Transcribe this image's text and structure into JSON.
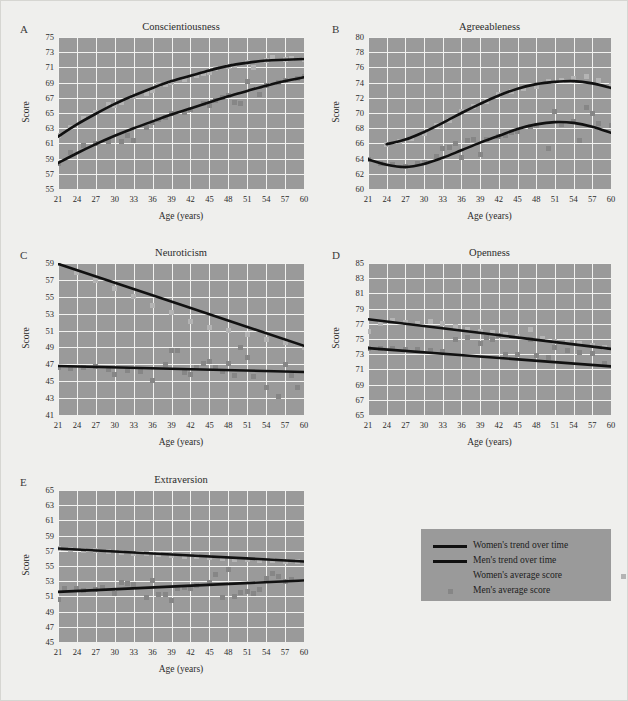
{
  "figure": {
    "background_color": "#efefed",
    "plot_background_color": "#9a9a9a",
    "grid_color": "#f2f2f0",
    "trend_line_color": "#111111",
    "women_marker_color": "#b4b4b4",
    "men_marker_color": "#868686"
  },
  "legend": {
    "items": [
      {
        "label": "Women's trend over time",
        "marker": "line-thick-black",
        "color": "#111111"
      },
      {
        "label": "Men's trend over time",
        "marker": "line-thick-black",
        "color": "#111111"
      },
      {
        "label": "Women's average score",
        "marker": "square",
        "color": "#b4b4b4"
      },
      {
        "label": "Men's average score",
        "marker": "square",
        "color": "#868686"
      }
    ]
  },
  "chart_data": [
    {
      "panel": "A",
      "type": "scatter",
      "title": "Conscientiousness",
      "xlabel": "Age (years)",
      "ylabel": "Score",
      "xlim": [
        21,
        60
      ],
      "ylim": [
        55,
        75
      ],
      "xticks": [
        21,
        24,
        27,
        30,
        33,
        36,
        39,
        42,
        45,
        48,
        51,
        54,
        57,
        60
      ],
      "yticks": [
        55,
        57,
        59,
        61,
        63,
        65,
        67,
        69,
        71,
        73,
        75
      ],
      "grid": true,
      "legend_position": "external-center",
      "series": [
        {
          "name": "Women's trend over time",
          "role": "trend",
          "x": [
            21,
            24,
            27,
            30,
            33,
            36,
            39,
            42,
            45,
            48,
            51,
            54,
            57,
            60
          ],
          "values": [
            61.9,
            63.5,
            64.9,
            66.2,
            67.3,
            68.3,
            69.2,
            69.9,
            70.6,
            71.2,
            71.6,
            71.9,
            72.0,
            72.1
          ]
        },
        {
          "name": "Men's trend over time",
          "role": "trend",
          "x": [
            21,
            24,
            27,
            30,
            33,
            36,
            39,
            42,
            45,
            48,
            51,
            54,
            57,
            60
          ],
          "values": [
            58.4,
            59.7,
            60.9,
            62.0,
            63.0,
            63.9,
            64.8,
            65.6,
            66.4,
            67.2,
            67.9,
            68.6,
            69.2,
            69.7
          ]
        },
        {
          "name": "Women's average score",
          "role": "points",
          "x": [
            21,
            23,
            25,
            27,
            29,
            30,
            31,
            33,
            35,
            36,
            37,
            38,
            39,
            41,
            43,
            44,
            45,
            46,
            48,
            49,
            51,
            52,
            54,
            55,
            57,
            58,
            60
          ],
          "values": [
            62.1,
            63.1,
            64.3,
            65.1,
            66.1,
            66.0,
            66.4,
            67.2,
            67.6,
            68.0,
            68.7,
            68.8,
            69.0,
            69.4,
            70.0,
            70.2,
            70.3,
            70.9,
            71.1,
            71.3,
            71.6,
            71.0,
            71.9,
            72.3,
            72.0,
            72.2,
            72.1
          ]
        },
        {
          "name": "Men's average score",
          "role": "points",
          "x": [
            21,
            23,
            25,
            27,
            29,
            31,
            32,
            33,
            35,
            36,
            37,
            38,
            39,
            41,
            42,
            44,
            45,
            46,
            47,
            48,
            49,
            50,
            51,
            53,
            54,
            56,
            57,
            59,
            60
          ],
          "values": [
            58.4,
            59.8,
            60.7,
            61.0,
            61.2,
            61.3,
            62.1,
            61.4,
            63.1,
            63.8,
            64.2,
            64.4,
            64.9,
            65.1,
            65.4,
            66.2,
            66.0,
            66.6,
            67.0,
            67.3,
            66.4,
            66.3,
            69.2,
            67.5,
            68.6,
            69.0,
            69.3,
            69.6,
            69.8
          ]
        }
      ]
    },
    {
      "panel": "B",
      "type": "scatter",
      "title": "Agreeableness",
      "xlabel": "Age (years)",
      "ylabel": "Score",
      "xlim": [
        21,
        60
      ],
      "ylim": [
        60,
        80
      ],
      "xticks": [
        21,
        24,
        27,
        30,
        33,
        36,
        39,
        42,
        45,
        48,
        51,
        54,
        57,
        60
      ],
      "yticks": [
        60,
        62,
        64,
        66,
        68,
        70,
        72,
        74,
        76,
        78,
        80
      ],
      "grid": true,
      "series": [
        {
          "name": "Women's trend over time",
          "role": "trend",
          "x": [
            24,
            27,
            30,
            33,
            36,
            39,
            42,
            45,
            48,
            51,
            54,
            57,
            60
          ],
          "values": [
            65.9,
            66.5,
            67.5,
            68.7,
            70.0,
            71.2,
            72.3,
            73.2,
            73.8,
            74.1,
            74.2,
            73.9,
            73.3
          ]
        },
        {
          "name": "Men's trend over time",
          "role": "trend",
          "x": [
            21,
            24,
            27,
            30,
            33,
            36,
            39,
            42,
            45,
            48,
            51,
            54,
            57,
            60
          ],
          "values": [
            63.9,
            63.2,
            62.9,
            63.3,
            64.1,
            65.1,
            66.1,
            67.0,
            67.9,
            68.5,
            68.8,
            68.7,
            68.2,
            67.4
          ]
        },
        {
          "name": "Women's average score",
          "role": "points",
          "x": [
            24,
            26,
            28,
            30,
            32,
            34,
            36,
            38,
            40,
            42,
            44,
            46,
            48,
            50,
            52,
            54,
            56,
            58,
            60
          ],
          "values": [
            65.9,
            66.3,
            66.6,
            67.3,
            68.4,
            69.0,
            70.2,
            70.8,
            71.5,
            72.4,
            72.8,
            73.2,
            73.5,
            74.1,
            74.3,
            74.6,
            74.8,
            74.3,
            73.6
          ]
        },
        {
          "name": "Men's average score",
          "role": "points",
          "x": [
            21,
            23,
            25,
            27,
            29,
            30,
            32,
            33,
            34,
            35,
            36,
            37,
            38,
            39,
            40,
            42,
            43,
            44,
            45,
            47,
            48,
            50,
            51,
            52,
            54,
            55,
            56,
            57,
            58,
            60
          ],
          "values": [
            63.9,
            63.4,
            63.2,
            63.0,
            63.4,
            63.5,
            64.3,
            65.3,
            65.5,
            66.0,
            64.1,
            66.4,
            66.5,
            64.6,
            66.5,
            66.9,
            67.0,
            67.4,
            67.6,
            68.2,
            68.4,
            65.3,
            70.2,
            68.5,
            68.9,
            66.4,
            70.7,
            69.9,
            68.6,
            68.4
          ]
        }
      ]
    },
    {
      "panel": "C",
      "type": "scatter",
      "title": "Neuroticism",
      "xlabel": "Age (years)",
      "ylabel": "Score",
      "xlim": [
        21,
        60
      ],
      "ylim": [
        41,
        59
      ],
      "xticks": [
        21,
        24,
        27,
        30,
        33,
        36,
        39,
        42,
        45,
        48,
        51,
        54,
        57,
        60
      ],
      "yticks": [
        41,
        43,
        45,
        47,
        49,
        51,
        53,
        55,
        57,
        59
      ],
      "grid": true,
      "series": [
        {
          "name": "Women's trend over time",
          "role": "trend",
          "x": [
            21,
            60
          ],
          "values": [
            58.9,
            49.2
          ]
        },
        {
          "name": "Men's trend over time",
          "role": "trend",
          "x": [
            21,
            60
          ],
          "values": [
            46.8,
            46.1
          ]
        },
        {
          "name": "Women's average score",
          "role": "points",
          "x": [
            21,
            24,
            27,
            30,
            33,
            36,
            39,
            42,
            45,
            48,
            51,
            54,
            57,
            60
          ],
          "values": [
            58.9,
            57.9,
            56.9,
            56.0,
            55.0,
            54.0,
            53.1,
            52.1,
            51.4,
            51.0,
            50.5,
            50.0,
            49.6,
            49.0
          ]
        },
        {
          "name": "Men's average score",
          "role": "points",
          "x": [
            21,
            23,
            25,
            27,
            29,
            30,
            32,
            34,
            36,
            38,
            39,
            40,
            41,
            42,
            43,
            44,
            45,
            46,
            47,
            48,
            49,
            50,
            51,
            52,
            54,
            56,
            57,
            58,
            59,
            60
          ],
          "values": [
            46.6,
            46.5,
            46.6,
            46.7,
            46.4,
            45.8,
            46.3,
            46.1,
            45.1,
            47.0,
            48.6,
            48.6,
            46.0,
            45.8,
            46.6,
            47.1,
            47.3,
            46.6,
            46.2,
            47.1,
            45.7,
            49.0,
            47.8,
            45.6,
            44.2,
            43.2,
            47.0,
            45.7,
            44.2,
            40.6
          ]
        }
      ]
    },
    {
      "panel": "D",
      "type": "scatter",
      "title": "Openness",
      "xlabel": "Age (years)",
      "ylabel": "Score",
      "xlim": [
        21,
        60
      ],
      "ylim": [
        65,
        85
      ],
      "xticks": [
        21,
        24,
        27,
        30,
        33,
        36,
        39,
        42,
        45,
        48,
        51,
        54,
        57,
        60
      ],
      "yticks": [
        65,
        67,
        69,
        71,
        73,
        75,
        77,
        79,
        81,
        83,
        85
      ],
      "grid": true,
      "series": [
        {
          "name": "Women's trend over time",
          "role": "trend",
          "x": [
            21,
            60
          ],
          "values": [
            77.6,
            73.7
          ]
        },
        {
          "name": "Men's trend over time",
          "role": "trend",
          "x": [
            21,
            60
          ],
          "values": [
            73.8,
            71.4
          ]
        },
        {
          "name": "Women's average score",
          "role": "points",
          "x": [
            21,
            23,
            25,
            27,
            29,
            31,
            33,
            35,
            37,
            39,
            41,
            43,
            45,
            47,
            49,
            51,
            53,
            55,
            57,
            59
          ],
          "values": [
            76.0,
            77.0,
            77.4,
            77.2,
            77.0,
            77.3,
            77.1,
            76.6,
            76.3,
            76.0,
            75.9,
            75.6,
            75.3,
            76.3,
            75.1,
            74.7,
            74.5,
            74.4,
            74.2,
            73.9
          ]
        },
        {
          "name": "Men's average score",
          "role": "points",
          "x": [
            21,
            23,
            25,
            27,
            29,
            31,
            33,
            35,
            37,
            39,
            40,
            41,
            42,
            43,
            45,
            47,
            48,
            50,
            51,
            53,
            55,
            57,
            59
          ],
          "values": [
            73.8,
            73.7,
            73.8,
            73.6,
            73.6,
            73.5,
            73.4,
            74.9,
            75.2,
            74.4,
            75.2,
            75.0,
            75.4,
            73.0,
            72.9,
            74.9,
            72.8,
            72.6,
            73.9,
            73.5,
            73.2,
            73.1,
            71.8
          ]
        }
      ]
    },
    {
      "panel": "E",
      "type": "scatter",
      "title": "Extraversion",
      "xlabel": "Age (years)",
      "ylabel": "Score",
      "xlim": [
        21,
        60
      ],
      "ylim": [
        45,
        65
      ],
      "xticks": [
        21,
        24,
        27,
        30,
        33,
        36,
        39,
        42,
        45,
        48,
        51,
        54,
        57,
        60
      ],
      "yticks": [
        45,
        47,
        49,
        51,
        53,
        55,
        57,
        59,
        61,
        63,
        65
      ],
      "grid": true,
      "series": [
        {
          "name": "Women's trend over time",
          "role": "trend",
          "x": [
            21,
            60
          ],
          "values": [
            57.3,
            55.6
          ]
        },
        {
          "name": "Men's trend over time",
          "role": "trend",
          "x": [
            21,
            60
          ],
          "values": [
            51.6,
            53.1
          ]
        },
        {
          "name": "Women's average score",
          "role": "points",
          "x": [
            21,
            23,
            25,
            27,
            29,
            31,
            33,
            35,
            37,
            39,
            41,
            43,
            45,
            47,
            49,
            51,
            53,
            55,
            57,
            59
          ],
          "values": [
            57.3,
            57.2,
            57.1,
            57.0,
            56.9,
            56.8,
            56.7,
            56.6,
            56.5,
            56.4,
            56.3,
            56.2,
            56.1,
            56.0,
            55.9,
            55.8,
            55.7,
            55.7,
            55.6,
            55.6
          ]
        },
        {
          "name": "Men's average score",
          "role": "points",
          "x": [
            21,
            22,
            24,
            25,
            27,
            28,
            30,
            31,
            32,
            33,
            35,
            36,
            37,
            38,
            39,
            40,
            41,
            42,
            43,
            45,
            46,
            47,
            48,
            49,
            50,
            51,
            52,
            53,
            54,
            55,
            56,
            57,
            58
          ],
          "values": [
            50.6,
            52.0,
            52.1,
            51.8,
            51.9,
            52.2,
            51.4,
            52.8,
            52.7,
            52.6,
            50.8,
            53.1,
            51.2,
            51.3,
            50.4,
            52.0,
            52.2,
            52.1,
            52.5,
            52.8,
            53.9,
            50.9,
            54.6,
            51.0,
            51.5,
            51.6,
            51.4,
            51.9,
            53.3,
            54.0,
            53.6,
            53.0,
            53.2
          ]
        }
      ]
    }
  ]
}
